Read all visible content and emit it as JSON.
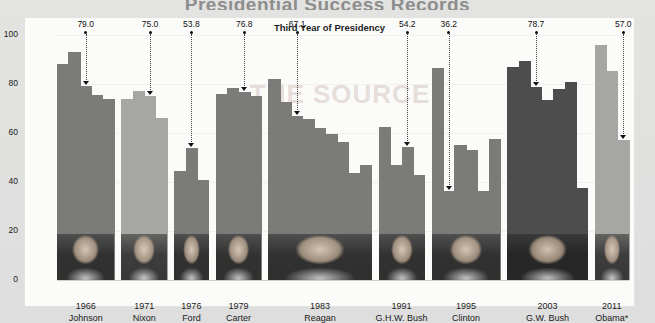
{
  "title": "Presidential Success Records",
  "subtitle": "Third Year of Presidency",
  "ghost_text": "THE SOURCE",
  "axes": {
    "ylabel": "Percentage of Legislation Passed",
    "yticks": [
      "0",
      "20",
      "40",
      "60",
      "80",
      "100"
    ],
    "ymin": 0,
    "ymax": 100
  },
  "chart_data": {
    "type": "bar",
    "title": "Presidential Success Records",
    "subtitle": "Third Year of Presidency",
    "xlabel": "",
    "ylabel": "Percentage of Legislation Passed",
    "ylim": [
      0,
      100
    ],
    "yticks": [
      0,
      20,
      40,
      60,
      80,
      100
    ],
    "grid": true,
    "legend": false,
    "note": "Each president is a group of yearly bars; the labeled callout value marks the third year of that presidency.",
    "categories": [
      "1966 Johnson",
      "1971 Nixon",
      "1976 Ford",
      "1979 Carter",
      "1983 Reagan",
      "1991 G.H.W. Bush",
      "1995 Clinton",
      "2003 G.W. Bush",
      "2011 Obama*"
    ],
    "highlight_values": [
      79.0,
      75.0,
      53.8,
      76.8,
      67.1,
      54.2,
      36.2,
      78.7,
      57.0
    ],
    "groups": [
      {
        "president": "Johnson",
        "year": "1966",
        "third_year_value": 79.0,
        "shade": "mid",
        "bars": [
          88.0,
          93.0,
          79.0,
          75.5,
          74.0
        ]
      },
      {
        "president": "Nixon",
        "year": "1971",
        "third_year_value": 75.0,
        "shade": "light",
        "bars": [
          74.0,
          77.0,
          75.0,
          66.0
        ]
      },
      {
        "president": "Ford",
        "year": "1976",
        "third_year_value": 53.8,
        "shade": "mid",
        "bars": [
          44.5,
          53.8,
          41.0
        ]
      },
      {
        "president": "Carter",
        "year": "1979",
        "third_year_value": 76.8,
        "shade": "mid",
        "bars": [
          76.0,
          78.3,
          76.8,
          75.0
        ]
      },
      {
        "president": "Reagan",
        "year": "1983",
        "third_year_value": 67.1,
        "shade": "mid",
        "bars": [
          82.0,
          72.5,
          67.1,
          65.8,
          62.0,
          59.5,
          56.2,
          43.5,
          47.0
        ]
      },
      {
        "president": "G.H.W. Bush",
        "year": "1991",
        "third_year_value": 54.2,
        "shade": "mid",
        "bars": [
          62.5,
          46.8,
          54.2,
          43.0
        ]
      },
      {
        "president": "Clinton",
        "year": "1995",
        "third_year_value": 36.2,
        "shade": "mid",
        "bars": [
          86.5,
          36.2,
          55.0,
          53.0,
          36.5,
          57.5
        ]
      },
      {
        "president": "G.W. Bush",
        "year": "2003",
        "third_year_value": 78.7,
        "shade": "dark",
        "bars": [
          87.0,
          89.5,
          78.7,
          73.5,
          78.0,
          81.0,
          37.5
        ]
      },
      {
        "president": "Obama*",
        "year": "2011",
        "third_year_value": 57.0,
        "shade": "light",
        "bars": [
          96.0,
          85.5,
          57.0
        ]
      }
    ]
  }
}
